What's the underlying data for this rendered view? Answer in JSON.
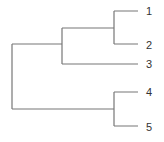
{
  "diagram": {
    "type": "dendrogram",
    "orientation": "horizontal",
    "line_color": "#777777",
    "leaves": [
      {
        "label": "1",
        "y": 11
      },
      {
        "label": "2",
        "y": 44
      },
      {
        "label": "3",
        "y": 64
      },
      {
        "label": "4",
        "y": 92
      },
      {
        "label": "5",
        "y": 126
      }
    ],
    "merges": [
      {
        "children": [
          "1",
          "2"
        ],
        "x": 114
      },
      {
        "children": [
          "(1,2)",
          "3"
        ],
        "x": 62
      },
      {
        "children": [
          "4",
          "5"
        ],
        "x": 114
      },
      {
        "children": [
          "(1,2,3)",
          "(4,5)"
        ],
        "x": 12
      }
    ]
  }
}
